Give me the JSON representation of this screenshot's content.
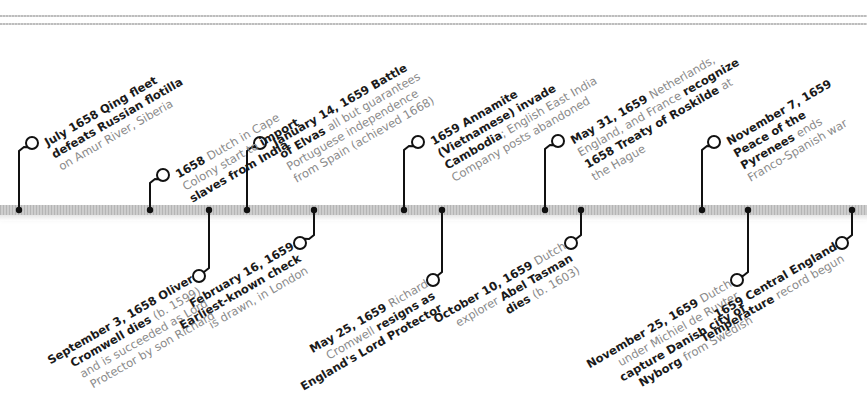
{
  "timeline": {
    "title": "",
    "colors": {
      "bar": "#bdbdbd",
      "stem": "#111111",
      "bold_text": "#1a1a1a",
      "light_text": "#8a8a8a"
    },
    "events_above": [
      {
        "x": 19,
        "cx": 32,
        "cy": 143,
        "lines": [
          [
            {
              "t": "July 1658 Qing fleet",
              "b": true
            }
          ],
          [
            {
              "t": "defeats Russian flotilla",
              "b": true
            }
          ],
          [
            {
              "t": "on Amur River, Siberia",
              "b": false
            }
          ]
        ]
      },
      {
        "x": 150,
        "cx": 163,
        "cy": 175,
        "lines": [
          [
            {
              "t": "1658 ",
              "b": true
            },
            {
              "t": "Dutch in Cape",
              "b": false
            }
          ],
          [
            {
              "t": "Colony start to ",
              "b": false
            },
            {
              "t": "import",
              "b": true
            }
          ],
          [
            {
              "t": "slaves from India",
              "b": true
            }
          ]
        ]
      },
      {
        "x": 247,
        "cx": 260,
        "cy": 143,
        "lines": [
          [
            {
              "t": "January 14, 1659 Battle",
              "b": true
            }
          ],
          [
            {
              "t": "of Elvas ",
              "b": true
            },
            {
              "t": "all but guarantees",
              "b": false
            }
          ],
          [
            {
              "t": "Portuguese independence",
              "b": false
            }
          ],
          [
            {
              "t": "from Spain (achieved 1668)",
              "b": false
            }
          ]
        ]
      },
      {
        "x": 404,
        "cx": 418,
        "cy": 142,
        "lines": [
          [
            {
              "t": "1659 Annamite",
              "b": true
            }
          ],
          [
            {
              "t": "(Vietnamese) invade",
              "b": true
            }
          ],
          [
            {
              "t": "Cambodia",
              "b": true
            },
            {
              "t": "; English East India",
              "b": false
            }
          ],
          [
            {
              "t": "Company posts abandoned",
              "b": false
            }
          ]
        ]
      },
      {
        "x": 545,
        "cx": 558,
        "cy": 141,
        "lines": [
          [
            {
              "t": "May 31, 1659 ",
              "b": true
            },
            {
              "t": "Netherlands,",
              "b": false
            }
          ],
          [
            {
              "t": "England, and France ",
              "b": false
            },
            {
              "t": "recognize",
              "b": true
            }
          ],
          [
            {
              "t": "1658 Treaty of Roskilde ",
              "b": true
            },
            {
              "t": "at",
              "b": false
            }
          ],
          [
            {
              "t": "the Hague",
              "b": false
            }
          ]
        ]
      },
      {
        "x": 702,
        "cx": 714,
        "cy": 142,
        "lines": [
          [
            {
              "t": "November 7, 1659",
              "b": true
            }
          ],
          [
            {
              "t": "Peace of the",
              "b": true
            }
          ],
          [
            {
              "t": "Pyrenees ",
              "b": true
            },
            {
              "t": "ends",
              "b": false
            }
          ],
          [
            {
              "t": "Franco-Spanish war",
              "b": false
            }
          ]
        ]
      }
    ],
    "events_below": [
      {
        "x": 209,
        "cx": 199,
        "cy": 276,
        "lines": [
          [
            {
              "t": "September 3, 1658 ",
              "b": true
            },
            {
              "t": "Oliver",
              "b": true
            }
          ],
          [
            {
              "t": "Cromwell dies ",
              "b": true
            },
            {
              "t": "(b. 1599)",
              "b": false
            }
          ],
          [
            {
              "t": "and is succeeded as Lord",
              "b": false
            }
          ],
          [
            {
              "t": "Protector by son Richard",
              "b": false
            }
          ]
        ]
      },
      {
        "x": 314,
        "cx": 300,
        "cy": 243,
        "lines": [
          [
            {
              "t": "February 16, 1659",
              "b": true
            }
          ],
          [
            {
              "t": "Earliest-known check",
              "b": true
            }
          ],
          [
            {
              "t": "is drawn, in London",
              "b": false
            }
          ]
        ]
      },
      {
        "x": 442,
        "cx": 433,
        "cy": 280,
        "lines": [
          [
            {
              "t": "May 25, 1659 ",
              "b": true
            },
            {
              "t": "Richard",
              "b": false
            }
          ],
          [
            {
              "t": "Cromwell ",
              "b": false
            },
            {
              "t": "resigns as",
              "b": true
            }
          ],
          [
            {
              "t": "England's Lord Protector",
              "b": true
            }
          ]
        ]
      },
      {
        "x": 581,
        "cx": 571,
        "cy": 243,
        "lines": [
          [
            {
              "t": "October 10, 1659 ",
              "b": true
            },
            {
              "t": "Dutch",
              "b": false
            }
          ],
          [
            {
              "t": "explorer ",
              "b": false
            },
            {
              "t": "Abel Tasman",
              "b": true
            }
          ],
          [
            {
              "t": "dies ",
              "b": true
            },
            {
              "t": "(b. 1603)",
              "b": false
            }
          ]
        ]
      },
      {
        "x": 748,
        "cx": 737,
        "cy": 280,
        "lines": [
          [
            {
              "t": "November 25, 1659 ",
              "b": true
            },
            {
              "t": "Dutch",
              "b": false
            }
          ],
          [
            {
              "t": "under Michiel de Ruyter",
              "b": false
            }
          ],
          [
            {
              "t": "capture Danish city of",
              "b": true
            }
          ],
          [
            {
              "t": "Nyborg ",
              "b": true
            },
            {
              "t": "from Swedish",
              "b": false
            }
          ]
        ]
      },
      {
        "x": 852,
        "cx": 842,
        "cy": 243,
        "lines": [
          [
            {
              "t": "1659 Central England",
              "b": true
            }
          ],
          [
            {
              "t": "Temperature ",
              "b": true
            },
            {
              "t": "record begun",
              "b": false
            }
          ]
        ]
      }
    ]
  }
}
